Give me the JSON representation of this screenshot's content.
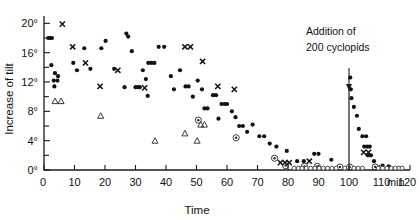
{
  "chart_data": {
    "type": "scatter",
    "title": "",
    "xlabel": "Time",
    "ylabel": "Increase of tilt",
    "x_unit": "min",
    "y_unit": "degrees",
    "xlim": [
      0,
      120
    ],
    "ylim": [
      0,
      21
    ],
    "xticks": [
      0,
      10,
      20,
      30,
      40,
      50,
      60,
      70,
      80,
      90,
      100,
      110,
      120
    ],
    "xticklabels": [
      "0",
      "10",
      "20",
      "30",
      "40",
      "50",
      "60",
      "70",
      "80",
      "90",
      "100",
      "110",
      "120"
    ],
    "x_unit_label": "min",
    "yticks": [
      0,
      2,
      4,
      6,
      8,
      10,
      12,
      14,
      16,
      18,
      20
    ],
    "yticklabels_major": [
      "0°",
      "4°",
      "8°",
      "12°",
      "16°",
      "20°"
    ],
    "ytick_major_values": [
      0,
      4,
      8,
      12,
      16,
      20
    ],
    "grid": false,
    "legend": "none",
    "annotations": [
      {
        "name": "addition-event",
        "text_line1": "Addition of",
        "text_line2": "200 cyclopids",
        "x": 100,
        "marker": "vertical-line-with-down-arrow"
      }
    ],
    "series": [
      {
        "name": "filled-dot",
        "marker": "dot",
        "points": [
          [
            1.4,
            18.0
          ],
          [
            2.0,
            18.0
          ],
          [
            2.6,
            18.0
          ],
          [
            2.4,
            14.3
          ],
          [
            3.6,
            13.2
          ],
          [
            3.2,
            12.2
          ],
          [
            4.4,
            12.2
          ],
          [
            3.4,
            11.4
          ],
          [
            4.6,
            12.8
          ],
          [
            9.6,
            14.6
          ],
          [
            10.8,
            13.6
          ],
          [
            13.2,
            16.6
          ],
          [
            15.2,
            13.8
          ],
          [
            18.8,
            16.6
          ],
          [
            20.2,
            17.6
          ],
          [
            23.0,
            13.8
          ],
          [
            27.0,
            18.6
          ],
          [
            27.6,
            18.2
          ],
          [
            28.8,
            16.2
          ],
          [
            30.0,
            11.3
          ],
          [
            30.8,
            11.3
          ],
          [
            31.4,
            11.3
          ],
          [
            26.4,
            11.3
          ],
          [
            32.4,
            13.6
          ],
          [
            34.2,
            14.6
          ],
          [
            35.2,
            14.6
          ],
          [
            36.2,
            14.6
          ],
          [
            33.4,
            12.4
          ],
          [
            34.0,
            10.1
          ],
          [
            37.6,
            16.8
          ],
          [
            39.4,
            16.8
          ],
          [
            41.6,
            12.8
          ],
          [
            42.6,
            11.0
          ],
          [
            44.6,
            13.6
          ],
          [
            46.4,
            11.4
          ],
          [
            47.4,
            11.4
          ],
          [
            48.8,
            10.0
          ],
          [
            50.4,
            12.2
          ],
          [
            51.8,
            11.0
          ],
          [
            52.6,
            8.4
          ],
          [
            53.6,
            8.4
          ],
          [
            55.4,
            10.2
          ],
          [
            56.4,
            10.2
          ],
          [
            57.2,
            7.0
          ],
          [
            58.2,
            9.0
          ],
          [
            59.2,
            9.0
          ],
          [
            60.0,
            9.0
          ],
          [
            61.6,
            8.0
          ],
          [
            62.8,
            7.2
          ],
          [
            64.0,
            6.0
          ],
          [
            65.2,
            6.0
          ],
          [
            66.6,
            5.2
          ],
          [
            68.4,
            6.2
          ],
          [
            70.6,
            4.6
          ],
          [
            72.2,
            4.6
          ],
          [
            74.0,
            3.6
          ],
          [
            76.2,
            3.2
          ],
          [
            79.6,
            2.6
          ],
          [
            83.0,
            1.2
          ],
          [
            85.2,
            1.2
          ],
          [
            88.6,
            2.2
          ],
          [
            90.0,
            2.2
          ],
          [
            94.2,
            1.4
          ],
          [
            100.4,
            12.6
          ],
          [
            100.6,
            11.0
          ],
          [
            100.8,
            9.8
          ],
          [
            101.6,
            8.6
          ],
          [
            102.6,
            7.4
          ],
          [
            103.2,
            5.6
          ],
          [
            104.4,
            4.6
          ],
          [
            105.6,
            4.6
          ],
          [
            105.0,
            3.2
          ],
          [
            106.0,
            3.2
          ],
          [
            106.8,
            3.2
          ],
          [
            106.2,
            2.0
          ],
          [
            107.2,
            2.0
          ],
          [
            108.2,
            1.2
          ],
          [
            111.0,
            0.6
          ],
          [
            113.0,
            0.5
          ]
        ]
      },
      {
        "name": "cross",
        "marker": "x",
        "points": [
          [
            6.0,
            19.9
          ],
          [
            9.4,
            16.8
          ],
          [
            13.6,
            14.6
          ],
          [
            18.4,
            11.4
          ],
          [
            24.2,
            13.6
          ],
          [
            33.0,
            11.2
          ],
          [
            46.2,
            16.8
          ],
          [
            48.0,
            16.8
          ],
          [
            52.0,
            14.8
          ],
          [
            57.0,
            11.4
          ],
          [
            62.4,
            11.0
          ],
          [
            77.5,
            1.0
          ],
          [
            79.0,
            1.0
          ],
          [
            80.4,
            1.0
          ],
          [
            87.0,
            1.2
          ],
          [
            104.8,
            2.4
          ],
          [
            106.4,
            2.4
          ]
        ]
      },
      {
        "name": "open-triangle",
        "marker": "triangle",
        "points": [
          [
            3.6,
            9.4
          ],
          [
            5.6,
            9.4
          ],
          [
            18.6,
            7.4
          ],
          [
            36.4,
            4.0
          ],
          [
            46.2,
            5.0
          ],
          [
            50.2,
            4.0
          ],
          [
            51.4,
            6.2
          ],
          [
            52.6,
            6.2
          ]
        ]
      },
      {
        "name": "circled-dot",
        "marker": "circle-dot",
        "points": [
          [
            50.6,
            6.8
          ],
          [
            63.0,
            4.4
          ],
          [
            75.6,
            1.6
          ],
          [
            79.2,
            0.6
          ],
          [
            85.4,
            0.5
          ],
          [
            89.6,
            0.5
          ],
          [
            97.0,
            0.4
          ],
          [
            100.2,
            0.4
          ],
          [
            108.6,
            0.4
          ]
        ]
      },
      {
        "name": "open-small-circle-baseline",
        "marker": "open-circle",
        "points": [
          [
            82.0,
            0.25
          ],
          [
            83.4,
            0.25
          ],
          [
            84.6,
            0.25
          ],
          [
            86.0,
            0.25
          ],
          [
            87.4,
            0.25
          ],
          [
            88.8,
            0.25
          ],
          [
            90.2,
            0.25
          ],
          [
            91.6,
            0.25
          ],
          [
            93.0,
            0.25
          ],
          [
            94.4,
            0.25
          ],
          [
            95.8,
            0.25
          ],
          [
            98.6,
            0.25
          ],
          [
            101.6,
            0.25
          ],
          [
            103.0,
            0.25
          ],
          [
            104.4,
            0.25
          ],
          [
            109.6,
            0.25
          ],
          [
            111.0,
            0.25
          ],
          [
            112.4,
            0.25
          ],
          [
            113.8,
            0.25
          ],
          [
            115.2,
            0.25
          ],
          [
            116.4,
            0.25
          ],
          [
            117.4,
            0.25
          ]
        ]
      }
    ]
  }
}
